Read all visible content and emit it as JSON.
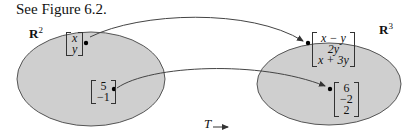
{
  "caption": "See Figure 6.2.",
  "domain_space": {
    "label": "R",
    "exponent": "2"
  },
  "codomain_space": {
    "label": "R",
    "exponent": "3"
  },
  "vectors_domain": [
    {
      "entries": [
        "x",
        "y"
      ]
    },
    {
      "entries": [
        "5",
        "−1"
      ]
    }
  ],
  "vectors_codomain": [
    {
      "entries": [
        "x − y",
        "2y",
        "x + 3y"
      ]
    },
    {
      "entries": [
        "6",
        "−2",
        "2"
      ]
    }
  ],
  "map_label": "T",
  "colors": {
    "ellipse_fill": "#cfcfcf",
    "ellipse_stroke": "#555555",
    "arrow": "#444444"
  }
}
